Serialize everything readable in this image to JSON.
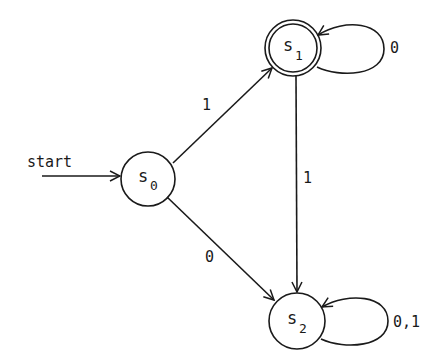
{
  "diagram": {
    "type": "finite-state-automaton",
    "start_label": "start",
    "states": [
      {
        "id": "s0",
        "name": "s",
        "subscript": "0",
        "accepting": false,
        "start": true
      },
      {
        "id": "s1",
        "name": "s",
        "subscript": "1",
        "accepting": true,
        "start": false
      },
      {
        "id": "s2",
        "name": "s",
        "subscript": "2",
        "accepting": false,
        "start": false
      }
    ],
    "transitions": [
      {
        "from": "s0",
        "to": "s1",
        "label": "1"
      },
      {
        "from": "s0",
        "to": "s2",
        "label": "0"
      },
      {
        "from": "s1",
        "to": "s2",
        "label": "1"
      },
      {
        "from": "s1",
        "to": "s1",
        "label": "0"
      },
      {
        "from": "s2",
        "to": "s2",
        "label": "0,1"
      }
    ]
  }
}
